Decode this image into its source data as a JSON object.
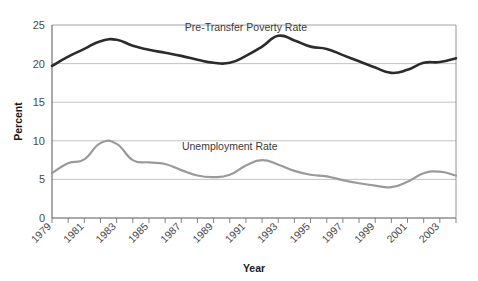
{
  "chart_data": {
    "type": "line",
    "title": "",
    "xlabel": "Year",
    "ylabel": "Percent",
    "ylim": [
      0,
      25
    ],
    "yticks": [
      0,
      5,
      10,
      15,
      20,
      25
    ],
    "ytick_labels": [
      "0",
      "5",
      "10",
      "15",
      "20",
      "25"
    ],
    "grid": true,
    "grid_axis": "y",
    "legend_position": "inline-annotation",
    "x": [
      1979,
      1980,
      1981,
      1982,
      1983,
      1984,
      1985,
      1986,
      1987,
      1988,
      1989,
      1990,
      1991,
      1992,
      1993,
      1994,
      1995,
      1996,
      1997,
      1998,
      1999,
      2000,
      2001,
      2002,
      2003,
      2004
    ],
    "xtick_labels": [
      "1979",
      "1981",
      "1983",
      "1985",
      "1987",
      "1989",
      "1991",
      "1993",
      "1995",
      "1997",
      "1999",
      "2001",
      "2003"
    ],
    "xtick_label_years": [
      1979,
      1981,
      1983,
      1985,
      1987,
      1989,
      1991,
      1993,
      1995,
      1997,
      1999,
      2001,
      2003
    ],
    "xlim": [
      1979,
      2004
    ],
    "series": [
      {
        "name": "Pre-Transfer Poverty Rate",
        "color": "#2b2b2b",
        "width": 2.6,
        "label_x": 1991,
        "label_y": 24.2,
        "values": [
          19.7,
          20.9,
          21.9,
          22.9,
          23.1,
          22.3,
          21.8,
          21.4,
          21.0,
          20.5,
          20.1,
          20.1,
          21.0,
          22.2,
          23.6,
          23.0,
          22.2,
          21.9,
          21.1,
          20.3,
          19.5,
          18.8,
          19.2,
          20.1,
          20.2,
          20.7
        ]
      },
      {
        "name": "Unemployment Rate",
        "color": "#9a9a9a",
        "width": 2.2,
        "label_x": 1990,
        "label_y": 8.8,
        "values": [
          5.8,
          7.1,
          7.6,
          9.7,
          9.6,
          7.5,
          7.2,
          7.0,
          6.2,
          5.5,
          5.3,
          5.6,
          6.8,
          7.5,
          6.9,
          6.1,
          5.6,
          5.4,
          4.9,
          4.5,
          4.2,
          4.0,
          4.7,
          5.8,
          6.0,
          5.5
        ]
      }
    ]
  },
  "axis": {
    "y_title": "Percent",
    "x_title": "Year"
  }
}
